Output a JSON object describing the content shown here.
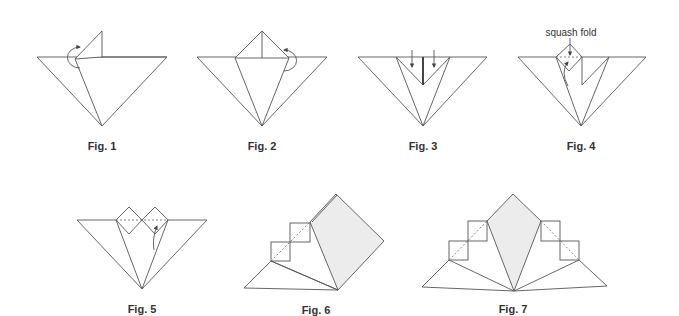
{
  "figures": [
    {
      "id": 1,
      "caption": "Fig. 1"
    },
    {
      "id": 2,
      "caption": "Fig. 2"
    },
    {
      "id": 3,
      "caption": "Fig. 3"
    },
    {
      "id": 4,
      "caption": "Fig. 4",
      "annotation": "squash fold"
    },
    {
      "id": 5,
      "caption": "Fig. 5"
    },
    {
      "id": 6,
      "caption": "Fig. 6"
    },
    {
      "id": 7,
      "caption": "Fig. 7"
    }
  ],
  "colors": {
    "line": "#555555",
    "shade": "#ececec",
    "background": "#ffffff"
  }
}
